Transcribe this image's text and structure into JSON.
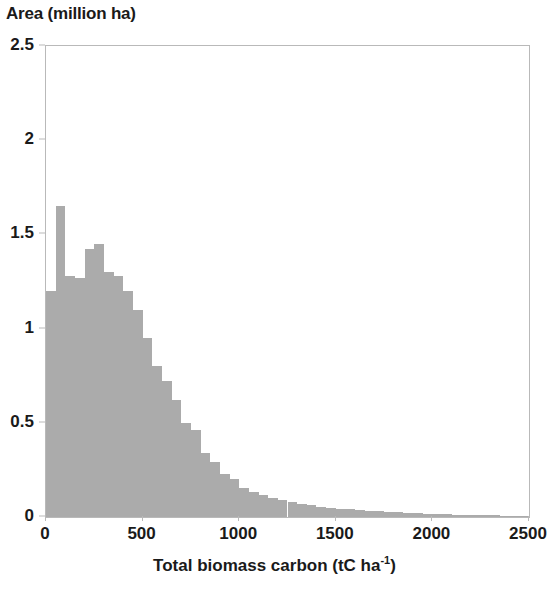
{
  "chart_data": {
    "type": "bar",
    "title": "",
    "ylabel": "Area (million ha)",
    "xlabel_prefix": "Total biomass carbon (tC ha",
    "xlabel_sup": "-1",
    "xlabel_suffix": ")",
    "xlabel": "Total biomass carbon (tC ha-1)",
    "xlim": [
      0,
      2500
    ],
    "ylim": [
      0,
      2.5
    ],
    "bin_width": 50,
    "grid": false,
    "legend": null,
    "bar_color": "#ababab",
    "axis_color": "#b9b9b9",
    "xticks": [
      0,
      500,
      1000,
      1500,
      2000,
      2500
    ],
    "xtick_labels": [
      "0",
      "500",
      "1000",
      "1500",
      "2000",
      "2500"
    ],
    "yticks": [
      0,
      0.5,
      1,
      1.5,
      2,
      2.5
    ],
    "ytick_labels": [
      "0",
      "0.5",
      "1",
      "1.5",
      "2",
      "2.5"
    ],
    "bin_starts": [
      0,
      50,
      100,
      150,
      200,
      250,
      300,
      350,
      400,
      450,
      500,
      550,
      600,
      650,
      700,
      750,
      800,
      850,
      900,
      950,
      1000,
      1050,
      1100,
      1150,
      1200,
      1250,
      1300,
      1350,
      1400,
      1450,
      1500,
      1550,
      1600,
      1650,
      1700,
      1750,
      1800,
      1850,
      1900,
      1950,
      2000,
      2050,
      2100,
      2150,
      2200,
      2250,
      2300,
      2350,
      2400,
      2450
    ],
    "values": [
      1.2,
      1.65,
      1.28,
      1.27,
      1.42,
      1.45,
      1.3,
      1.28,
      1.2,
      1.1,
      0.95,
      0.8,
      0.72,
      0.62,
      0.5,
      0.46,
      0.34,
      0.29,
      0.23,
      0.2,
      0.155,
      0.135,
      0.115,
      0.1,
      0.09,
      0.08,
      0.07,
      0.062,
      0.055,
      0.05,
      0.045,
      0.04,
      0.036,
      0.033,
      0.03,
      0.027,
      0.024,
      0.022,
      0.02,
      0.018,
      0.016,
      0.015,
      0.013,
      0.012,
      0.011,
      0.01,
      0.009,
      0.008,
      0.007,
      0.006
    ]
  }
}
